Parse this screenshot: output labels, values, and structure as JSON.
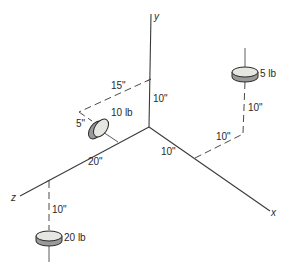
{
  "diagram": {
    "type": "3D isometric coordinate axes with point weights",
    "axes": {
      "x": {
        "label": "x"
      },
      "y": {
        "label": "y"
      },
      "z": {
        "label": "z"
      }
    },
    "dimensions": {
      "y_height": "10\"",
      "along_z_from_y": "15\"",
      "offset_5": "5\"",
      "z_distance": "20\"",
      "x_distance": "10\"",
      "x_offset_to_5lb": "10\"",
      "vertical_5lb": "10\"",
      "vertical_20lb": "10\""
    },
    "weights": [
      {
        "id": "w10",
        "label": "10 lb"
      },
      {
        "id": "w5",
        "label": "5 lb"
      },
      {
        "id": "w20",
        "label": "20 lb"
      }
    ]
  }
}
